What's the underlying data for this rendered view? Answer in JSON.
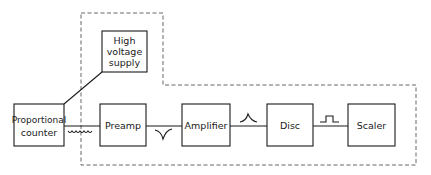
{
  "diagram": {
    "type": "block-diagram",
    "enclosure": {
      "style": "dashed",
      "color": "#555555"
    },
    "blocks": [
      {
        "id": "hv",
        "label_lines": [
          "High",
          "voltage",
          "supply"
        ],
        "x": 102,
        "y": 31,
        "w": 45,
        "h": 41
      },
      {
        "id": "counter",
        "label_lines": [
          "Proportional",
          "counter"
        ],
        "x": 14,
        "y": 104,
        "w": 50,
        "h": 42
      },
      {
        "id": "preamp",
        "label_lines": [
          "Preamp"
        ],
        "x": 100,
        "y": 104,
        "w": 46,
        "h": 42
      },
      {
        "id": "amplifier",
        "label_lines": [
          "Amplifier"
        ],
        "x": 182,
        "y": 104,
        "w": 48,
        "h": 42
      },
      {
        "id": "disc",
        "label_lines": [
          "Disc"
        ],
        "x": 267,
        "y": 104,
        "w": 46,
        "h": 42
      },
      {
        "id": "scaler",
        "label_lines": [
          "Scaler"
        ],
        "x": 348,
        "y": 104,
        "w": 47,
        "h": 42
      }
    ],
    "connections": [
      {
        "from": "counter",
        "to": "hv",
        "style": "diagonal"
      },
      {
        "from": "counter",
        "to": "preamp",
        "signal": "noise-coil"
      },
      {
        "from": "preamp",
        "to": "amplifier",
        "signal": "negative-pulse"
      },
      {
        "from": "amplifier",
        "to": "disc",
        "signal": "gaussian-pulse"
      },
      {
        "from": "disc",
        "to": "scaler",
        "signal": "square-pulse"
      }
    ]
  }
}
